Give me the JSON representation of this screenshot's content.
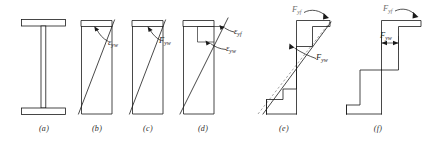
{
  "figure": {
    "name": "web-stress-strain-distributions",
    "background_color": "#ffffff",
    "line_color": "#1a1a1a",
    "dashed_line_color": "#8d8d8d",
    "panels": [
      {
        "id": "a",
        "caption": "(a)",
        "description": "I-beam cross section with top flange, web and bottom flange",
        "labels": []
      },
      {
        "id": "b",
        "caption": "(b)",
        "description": "Linear strain distribution across web depth",
        "labels": [
          {
            "name": "epsilon-yw",
            "symbol": "ε",
            "sub": "yw"
          }
        ]
      },
      {
        "id": "c",
        "caption": "(c)",
        "description": "Linear stress distribution across web depth",
        "labels": [
          {
            "name": "F-yw",
            "symbol": "F",
            "sub": "yw"
          }
        ]
      },
      {
        "id": "d",
        "caption": "(d)",
        "description": "Strain distribution with flange and web yield strains marked",
        "labels": [
          {
            "name": "epsilon-yf",
            "symbol": "ε",
            "sub": "yf"
          },
          {
            "name": "epsilon-yw",
            "symbol": "ε",
            "sub": "yw"
          }
        ]
      },
      {
        "id": "e",
        "caption": "(e)",
        "description": "Partially plastified stress distribution with elastic dashed reference line",
        "labels": [
          {
            "name": "F-yf",
            "symbol": "F",
            "sub": "yf"
          },
          {
            "name": "F-yw",
            "symbol": "F",
            "sub": "yw"
          }
        ]
      },
      {
        "id": "f",
        "caption": "(f)",
        "description": "Fully plastic stress block with web yield stress dimension",
        "labels": [
          {
            "name": "F-yf",
            "symbol": "F",
            "sub": "yf"
          },
          {
            "name": "F-yw",
            "symbol": "F",
            "sub": "yw"
          }
        ]
      }
    ]
  },
  "captions": {
    "a": "(a)",
    "b": "(b)",
    "c": "(c)",
    "d": "(d)",
    "e": "(e)",
    "f": "(f)"
  },
  "labels": {
    "b_eps_yw": {
      "sym": "ε",
      "sub": "yw"
    },
    "c_F_yw": {
      "sym": "F",
      "sub": "yw"
    },
    "d_eps_yf": {
      "sym": "ε",
      "sub": "yf"
    },
    "d_eps_yw": {
      "sym": "ε",
      "sub": "yw"
    },
    "e_F_yf": {
      "sym": "F",
      "sub": "yf"
    },
    "e_F_yw": {
      "sym": "F",
      "sub": "yw"
    },
    "f_F_yf": {
      "sym": "F",
      "sub": "yf"
    },
    "f_F_yw": {
      "sym": "F",
      "sub": "yw"
    }
  }
}
